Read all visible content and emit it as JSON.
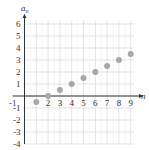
{
  "chart_data": {
    "type": "scatter",
    "title": "",
    "xlabel": "n",
    "ylabel": "a_n",
    "ylabel_main": "a",
    "ylabel_sub": "n",
    "x": [
      1,
      2,
      3,
      4,
      5,
      6,
      7,
      8,
      9
    ],
    "series": [
      {
        "name": "a_n",
        "values": [
          -0.5,
          0,
          0.5,
          1,
          1.5,
          2,
          2.5,
          3,
          3.5
        ]
      }
    ],
    "xlim": [
      -1,
      10
    ],
    "ylim": [
      -4,
      6.5
    ],
    "x_ticks": [
      "-1",
      "2",
      "3",
      "4",
      "5",
      "6",
      "7",
      "8",
      "9"
    ],
    "y_ticks": [
      "6",
      "5",
      "4",
      "3",
      "2",
      "1",
      "-1",
      "-2",
      "-3",
      "-4"
    ],
    "grid": true,
    "colors": {
      "point": "#a8a8a8",
      "grid": "#dcdcdc",
      "axis": "#333333"
    }
  }
}
